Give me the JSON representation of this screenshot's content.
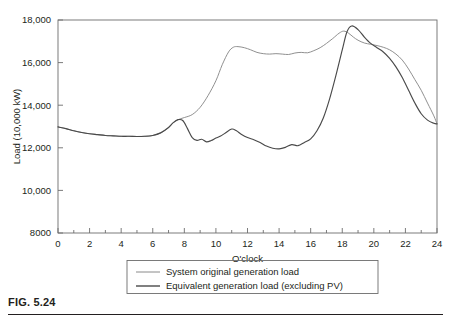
{
  "figure": {
    "caption_label": "FIG. 5.24"
  },
  "chart_data": {
    "type": "line",
    "title": "",
    "xlabel": "O'clock",
    "ylabel": "Load (10,000 kW)",
    "xlim": [
      0,
      24
    ],
    "ylim": [
      8000,
      18000
    ],
    "xticks": [
      0,
      2,
      4,
      6,
      8,
      10,
      12,
      14,
      16,
      18,
      20,
      22,
      24
    ],
    "xtick_labels": [
      "0",
      "2",
      "4",
      "6",
      "8",
      "10",
      "12",
      "14",
      "16",
      "18",
      "20",
      "22",
      "24"
    ],
    "yticks": [
      8000,
      10000,
      12000,
      14000,
      16000,
      18000
    ],
    "ytick_labels": [
      "8000",
      "10,000",
      "12,000",
      "14,000",
      "16,000",
      "18,000"
    ],
    "grid": false,
    "legend_position": "below-plot",
    "series": [
      {
        "name": "System original generation load",
        "color": "#8a8a8a",
        "x": [
          0,
          0.5,
          1,
          1.5,
          2,
          2.5,
          3,
          3.5,
          4,
          4.5,
          5,
          5.5,
          6,
          6.5,
          7,
          7.3,
          7.6,
          8,
          8.5,
          9,
          9.5,
          10,
          10.4,
          10.8,
          11.1,
          11.4,
          11.8,
          12.2,
          12.6,
          13,
          13.4,
          13.8,
          14.2,
          14.6,
          15,
          15.4,
          15.8,
          16.2,
          16.6,
          17,
          17.4,
          17.8,
          18.1,
          18.4,
          18.7,
          19,
          19.4,
          19.8,
          20.2,
          20.6,
          21,
          21.4,
          21.8,
          22.2,
          22.6,
          23,
          23.4,
          23.8,
          24
        ],
        "y": [
          12980,
          12900,
          12800,
          12720,
          12660,
          12620,
          12580,
          12560,
          12540,
          12540,
          12530,
          12540,
          12580,
          12700,
          12950,
          13180,
          13320,
          13420,
          13560,
          13900,
          14450,
          15150,
          15900,
          16500,
          16720,
          16750,
          16700,
          16600,
          16480,
          16420,
          16400,
          16420,
          16400,
          16380,
          16450,
          16480,
          16460,
          16560,
          16700,
          16900,
          17130,
          17380,
          17480,
          17380,
          17200,
          17050,
          16920,
          16860,
          16800,
          16720,
          16600,
          16400,
          16120,
          15700,
          15200,
          14700,
          14100,
          13500,
          13120
        ]
      },
      {
        "name": "Equivalent generation load (excluding PV)",
        "color": "#4a4a4a",
        "x": [
          0,
          0.5,
          1,
          1.5,
          2,
          2.5,
          3,
          3.5,
          4,
          4.5,
          5,
          5.5,
          6,
          6.5,
          7,
          7.3,
          7.6,
          7.9,
          8.2,
          8.5,
          8.8,
          9.1,
          9.4,
          9.7,
          10,
          10.3,
          10.6,
          11,
          11.3,
          11.6,
          12,
          12.4,
          12.8,
          13.2,
          13.6,
          14,
          14.4,
          14.8,
          15.2,
          15.6,
          16,
          16.4,
          16.8,
          17.2,
          17.6,
          18,
          18.3,
          18.6,
          19,
          19.4,
          19.8,
          20.2,
          20.6,
          21,
          21.4,
          21.8,
          22.2,
          22.6,
          23,
          23.4,
          23.8,
          24
        ],
        "y": [
          12980,
          12900,
          12800,
          12720,
          12660,
          12620,
          12580,
          12560,
          12540,
          12540,
          12530,
          12540,
          12580,
          12700,
          12950,
          13180,
          13320,
          13280,
          12900,
          12480,
          12350,
          12400,
          12280,
          12340,
          12460,
          12550,
          12700,
          12880,
          12800,
          12640,
          12480,
          12380,
          12250,
          12080,
          11980,
          11950,
          12020,
          12150,
          12100,
          12250,
          12420,
          12800,
          13400,
          14300,
          15400,
          16600,
          17450,
          17720,
          17550,
          17200,
          16900,
          16700,
          16500,
          16200,
          15800,
          15300,
          14700,
          14100,
          13600,
          13300,
          13150,
          13120
        ]
      }
    ]
  },
  "legend": {
    "items": [
      {
        "label": "System original generation load",
        "color": "#8a8a8a"
      },
      {
        "label": "Equivalent generation load (excluding PV)",
        "color": "#4a4a4a"
      }
    ]
  }
}
